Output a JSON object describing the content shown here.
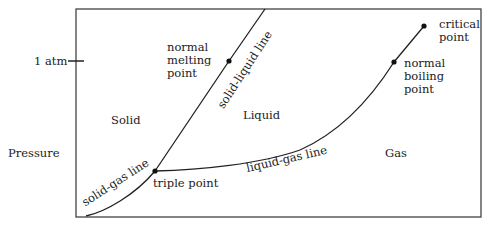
{
  "diagram": {
    "type": "phase-diagram",
    "axis": {
      "y_label": "Pressure",
      "y_tick_label": "1 atm"
    },
    "regions": {
      "solid": "Solid",
      "liquid": "Liquid",
      "gas": "Gas"
    },
    "lines": {
      "solid_liquid": "solid-liquid line",
      "solid_gas": "solid-gas line",
      "liquid_gas": "liquid-gas line"
    },
    "points": {
      "triple": "triple point",
      "normal_melting": [
        "normal",
        "melting",
        "point"
      ],
      "normal_boiling": [
        "normal",
        "boiling",
        "point"
      ],
      "critical": [
        "critical",
        "point"
      ]
    },
    "colors": {
      "line": "#222222",
      "background": "#ffffff"
    }
  }
}
